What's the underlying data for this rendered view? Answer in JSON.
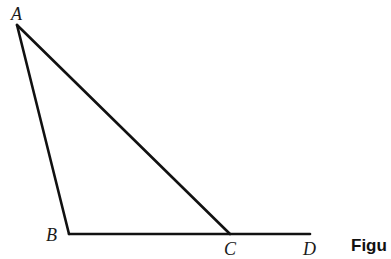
{
  "diagram": {
    "type": "geometry-triangle-with-extended-side",
    "points": {
      "A": {
        "label": "A",
        "x": 17,
        "y": 25
      },
      "B": {
        "label": "B",
        "x": 69,
        "y": 234
      },
      "C": {
        "label": "C",
        "x": 230,
        "y": 234
      },
      "D": {
        "label": "D",
        "x": 310,
        "y": 234
      }
    },
    "segments": [
      [
        "A",
        "B"
      ],
      [
        "A",
        "C"
      ],
      [
        "B",
        "D"
      ]
    ],
    "caption": "Figu"
  }
}
